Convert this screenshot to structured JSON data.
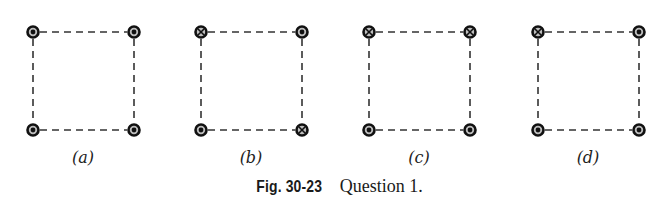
{
  "figure": {
    "caption_number": "Fig. 30-23",
    "caption_text": "Question 1.",
    "legend": {
      "dot": "current out of page",
      "cross": "current into page"
    },
    "panels": [
      {
        "label": "(a)",
        "corners": {
          "top_left": "dot",
          "top_right": "dot",
          "bottom_left": "dot",
          "bottom_right": "dot"
        }
      },
      {
        "label": "(b)",
        "corners": {
          "top_left": "cross",
          "top_right": "dot",
          "bottom_left": "dot",
          "bottom_right": "cross"
        }
      },
      {
        "label": "(c)",
        "corners": {
          "top_left": "cross",
          "top_right": "cross",
          "bottom_left": "dot",
          "bottom_right": "dot"
        }
      },
      {
        "label": "(d)",
        "corners": {
          "top_left": "cross",
          "top_right": "dot",
          "bottom_left": "dot",
          "bottom_right": "dot"
        }
      }
    ]
  }
}
